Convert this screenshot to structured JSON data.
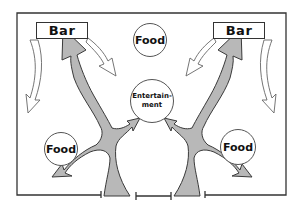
{
  "diagram": {
    "type": "floor-plan-flow",
    "labels": {
      "bar_left": "Bar",
      "bar_right": "Bar",
      "food_top": "Food",
      "food_left": "Food",
      "food_right": "Food",
      "entertainment_line1": "Entertain-",
      "entertainment_line2": "ment"
    },
    "colors": {
      "frame": "#333333",
      "flow_fill": "#b5b5b5",
      "flow_stroke": "#444444",
      "outline_arrow": "#666666",
      "background": "#ffffff"
    }
  }
}
